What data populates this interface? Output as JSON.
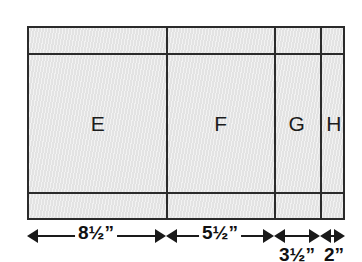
{
  "figure": {
    "panel": {
      "sections": [
        {
          "id": "E",
          "label": "E"
        },
        {
          "id": "F",
          "label": "F"
        },
        {
          "id": "G",
          "label": "G"
        },
        {
          "id": "H",
          "label": "H"
        }
      ],
      "fill_color": "#e3e3e3",
      "line_color": "#2b2b2b"
    },
    "dimensions": [
      {
        "id": "dim-e",
        "label": "8½”",
        "section": "E",
        "placement": "inline"
      },
      {
        "id": "dim-f",
        "label": "5½”",
        "section": "F",
        "placement": "inline"
      },
      {
        "id": "dim-g",
        "label": "3½”",
        "section": "G",
        "placement": "below"
      },
      {
        "id": "dim-h",
        "label": "2”",
        "section": "H",
        "placement": "below"
      }
    ]
  }
}
